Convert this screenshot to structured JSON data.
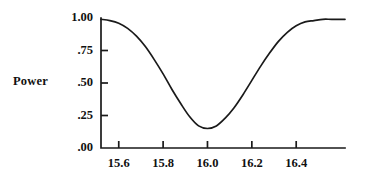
{
  "chart_data": {
    "type": "line",
    "title": "",
    "subtitle": "",
    "xlabel": "",
    "ylabel": "Power",
    "xlim": [
      15.52,
      16.62
    ],
    "ylim": [
      0.0,
      1.0
    ],
    "grid": false,
    "legend": null,
    "annotations": [],
    "x_tick_labels": [
      "15.6",
      "15.8",
      "16.0",
      "16.2",
      "16.4"
    ],
    "x_tick_values": [
      15.6,
      15.8,
      16.0,
      16.2,
      16.4
    ],
    "y_tick_labels": [
      "1.00",
      ".75",
      ".50",
      ".25",
      ".00"
    ],
    "y_tick_values": [
      1.0,
      0.75,
      0.5,
      0.25,
      0.0
    ],
    "series": [
      {
        "name": "Power",
        "color": "#1a1a1a",
        "line_width": 1.7,
        "x": [
          15.52,
          15.56,
          15.6,
          15.64,
          15.68,
          15.72,
          15.76,
          15.8,
          15.84,
          15.88,
          15.92,
          15.96,
          16.0,
          16.04,
          16.08,
          16.12,
          16.16,
          16.2,
          16.24,
          16.28,
          16.32,
          16.36,
          16.4,
          16.44,
          16.48,
          16.52,
          16.56,
          16.62
        ],
        "values": [
          0.99,
          0.98,
          0.96,
          0.92,
          0.86,
          0.78,
          0.68,
          0.57,
          0.45,
          0.34,
          0.24,
          0.17,
          0.15,
          0.17,
          0.23,
          0.31,
          0.41,
          0.52,
          0.63,
          0.73,
          0.82,
          0.89,
          0.94,
          0.97,
          0.98,
          0.99,
          0.99,
          0.99
        ]
      }
    ],
    "minimum": {
      "x": 16.0,
      "y": 0.15
    },
    "endpoints": {
      "left": 0.99,
      "right": 0.99
    }
  },
  "geometry": {
    "plot_left": 101,
    "plot_right": 345,
    "plot_top": 18,
    "plot_bottom": 148,
    "axis_color": "#1a1a1a",
    "axis_width": 1.7,
    "tick_length": 7,
    "x_tick_length": 7
  }
}
